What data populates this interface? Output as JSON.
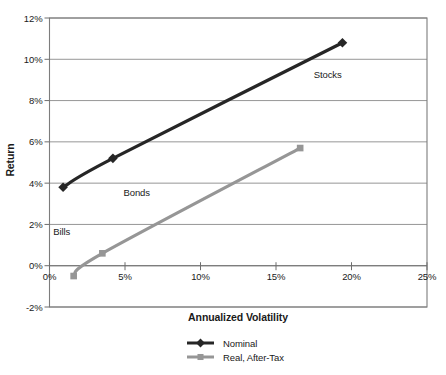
{
  "chart_data": {
    "type": "line",
    "title": "",
    "xlabel": "Annualized Volatility",
    "ylabel": "Return",
    "xlim": [
      0,
      25
    ],
    "ylim": [
      -2,
      12
    ],
    "grid": "horizontal",
    "legend_position": "bottom-center",
    "x_ticks": [
      {
        "v": 0,
        "label": "0%"
      },
      {
        "v": 5,
        "label": "5%"
      },
      {
        "v": 10,
        "label": "10%"
      },
      {
        "v": 15,
        "label": "15%"
      },
      {
        "v": 20,
        "label": "20%"
      },
      {
        "v": 25,
        "label": "25%"
      }
    ],
    "y_ticks": [
      {
        "v": -2,
        "label": "-2%"
      },
      {
        "v": 0,
        "label": "0%"
      },
      {
        "v": 2,
        "label": "2%"
      },
      {
        "v": 4,
        "label": "4%"
      },
      {
        "v": 6,
        "label": "6%"
      },
      {
        "v": 8,
        "label": "8%"
      },
      {
        "v": 10,
        "label": "10%"
      },
      {
        "v": 12,
        "label": "12%"
      }
    ],
    "series": [
      {
        "name": "Nominal",
        "color": "#262626",
        "marker": "diamond",
        "points": [
          {
            "asset": "Bills",
            "x": 0.9,
            "y": 3.8
          },
          {
            "asset": "Bonds",
            "x": 4.2,
            "y": 5.2
          },
          {
            "asset": "Stocks",
            "x": 19.4,
            "y": 10.8
          }
        ]
      },
      {
        "name": "Real, After-Tax",
        "color": "#969696",
        "marker": "square",
        "points": [
          {
            "asset": "Bills",
            "x": 1.6,
            "y": -0.5
          },
          {
            "asset": "Bonds",
            "x": 3.5,
            "y": 0.6
          },
          {
            "asset": "Stocks",
            "x": 16.6,
            "y": 5.7
          }
        ]
      }
    ],
    "annotations": [
      {
        "text": "Stocks",
        "x": 17.5,
        "y": 9.1
      },
      {
        "text": "Bonds",
        "x": 4.9,
        "y": 3.4
      },
      {
        "text": "Bills",
        "x": 0.25,
        "y": 1.5
      }
    ],
    "colors": {
      "background": "#ffffff",
      "grid": "#8a8a8a",
      "axis": "#6e6e6e",
      "border": "#7d7d7d",
      "text": "#1a1a1a"
    }
  }
}
